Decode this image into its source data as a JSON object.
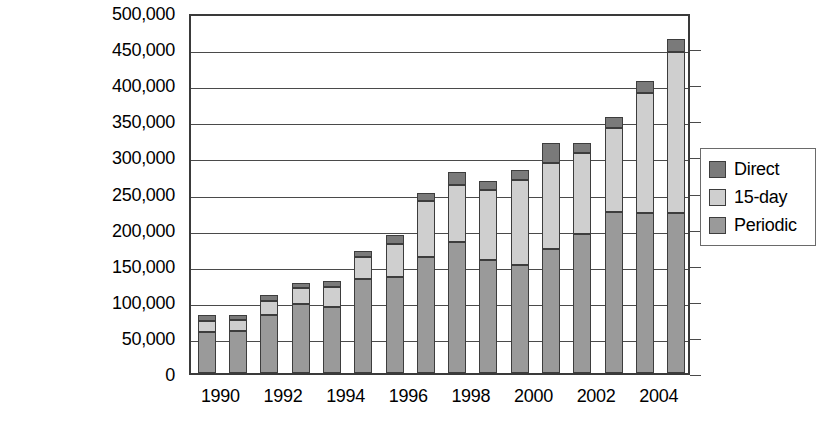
{
  "chart_data": {
    "type": "bar",
    "stacked": true,
    "title": "",
    "subtitle": "",
    "xlabel": "",
    "ylabel": "",
    "categories": [
      "1990",
      "1991",
      "1992",
      "1993",
      "1994",
      "1995",
      "1996",
      "1997",
      "1998",
      "1999",
      "2000",
      "2001",
      "2002",
      "2003",
      "2004",
      "2005"
    ],
    "x_tick_labels": [
      "1990",
      "1992",
      "1994",
      "1996",
      "1998",
      "2000",
      "2002",
      "2004"
    ],
    "y_tick_labels": [
      "500,000",
      "450,000",
      "400,000",
      "350,000",
      "300,000",
      "250,000",
      "200,000",
      "150,000",
      "100,000",
      "50,000",
      "0"
    ],
    "y_tick_values": [
      500000,
      450000,
      400000,
      350000,
      300000,
      250000,
      200000,
      150000,
      100000,
      50000,
      0
    ],
    "ylim": [
      0,
      500000
    ],
    "grid": true,
    "legend_position": "right",
    "series": [
      {
        "name": "Periodic",
        "color": "#9a9a9a",
        "values": [
          57000,
          58000,
          80000,
          96000,
          92000,
          130000,
          133000,
          160000,
          182000,
          157000,
          150000,
          172000,
          192000,
          223000,
          222000,
          222000
        ]
      },
      {
        "name": "15-day",
        "color": "#cfcfcf",
        "values": [
          15000,
          15000,
          20000,
          22000,
          27000,
          30000,
          46000,
          78000,
          78000,
          96000,
          118000,
          119000,
          113000,
          117000,
          166000,
          223000
        ]
      },
      {
        "name": "Direct",
        "color": "#7a7a7a",
        "values": [
          8000,
          7000,
          8000,
          7000,
          8000,
          9000,
          12000,
          12000,
          18000,
          13000,
          13000,
          27000,
          13000,
          15000,
          17000,
          18000
        ]
      }
    ],
    "stack_order_bottom_to_top": [
      "Periodic",
      "15-day",
      "Direct"
    ],
    "totals": [
      80000,
      80000,
      108000,
      125000,
      127000,
      141000,
      170000,
      198000,
      247000,
      278000,
      265000,
      281000,
      318000,
      355000,
      405000,
      463000
    ]
  },
  "legend": {
    "items": [
      {
        "label": "Direct",
        "color": "#7a7a7a"
      },
      {
        "label": "15-day",
        "color": "#cfcfcf"
      },
      {
        "label": "Periodic",
        "color": "#9a9a9a"
      }
    ]
  },
  "colors": {
    "direct": "#7a7a7a",
    "fifteen_day": "#cfcfcf",
    "periodic": "#9a9a9a",
    "axis": "#3a3a3a",
    "gridline": "#4a4a4a",
    "background": "#ffffff"
  }
}
